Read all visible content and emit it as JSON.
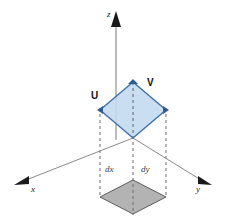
{
  "figure": {
    "background_color": "#ffffff"
  },
  "axes": {
    "origin": {
      "x": 133,
      "y": 138
    },
    "items": [
      {
        "name": "z",
        "label": "z",
        "label_x": 110,
        "label_y": 16,
        "line": {
          "x1": 116,
          "y1": 138,
          "x2": 116,
          "y2": 22
        },
        "arrow": "up",
        "color": "#8c8c8c"
      },
      {
        "name": "x",
        "label": "x",
        "label_x": 31,
        "label_y": 192,
        "line": {
          "x1": 133,
          "y1": 138,
          "x2": 22,
          "y2": 182
        },
        "arrow": "down-left",
        "color": "#6f6f6f"
      },
      {
        "name": "y",
        "label": "y",
        "label_x": 196,
        "label_y": 192,
        "line": {
          "x1": 133,
          "y1": 138,
          "x2": 205,
          "y2": 182
        },
        "arrow": "down-right",
        "color": "#6f6f6f"
      }
    ]
  },
  "blue_face": {
    "name": "parallelogram-uv",
    "fill": "#c3d9ef",
    "stroke": "#3e6fa8",
    "opacity": 0.85,
    "vertices": [
      {
        "x": 133,
        "y": 82
      },
      {
        "x": 166,
        "y": 110
      },
      {
        "x": 133,
        "y": 138
      },
      {
        "x": 100,
        "y": 110
      }
    ],
    "vertex_markers": [
      {
        "x": 133,
        "y": 82
      },
      {
        "x": 166,
        "y": 110
      },
      {
        "x": 100,
        "y": 110
      }
    ]
  },
  "gray_face": {
    "name": "projection-square",
    "fill": "#b3b3b3",
    "stroke": "#5d5d5d",
    "vertices": [
      {
        "x": 133,
        "y": 180
      },
      {
        "x": 166,
        "y": 197
      },
      {
        "x": 133,
        "y": 214
      },
      {
        "x": 100,
        "y": 197
      }
    ]
  },
  "vectors": [
    {
      "name": "U",
      "label": "U",
      "label_x": 93,
      "label_y": 98
    },
    {
      "name": "V",
      "label": "V",
      "label_x": 148,
      "label_y": 85
    }
  ],
  "dimension_labels": [
    {
      "name": "dx",
      "label": "dx",
      "label_x": 105,
      "label_y": 170
    },
    {
      "name": "dy",
      "label": "dy",
      "label_x": 141,
      "label_y": 170
    }
  ],
  "dashed_lines": {
    "color": "#6b6b6b",
    "dash": "3,3",
    "segments": [
      {
        "name": "drop-left",
        "x1": 100,
        "y1": 110,
        "x2": 100,
        "y2": 197
      },
      {
        "name": "drop-center",
        "x1": 133,
        "y1": 82,
        "x2": 133,
        "y2": 214
      },
      {
        "name": "drop-right",
        "x1": 166,
        "y1": 110,
        "x2": 166,
        "y2": 197
      }
    ]
  },
  "colors": {
    "blue_fill": "#c3d9ef",
    "blue_stroke": "#3e6fa8",
    "gray_fill": "#b3b3b3",
    "gray_stroke": "#5d5d5d",
    "axis": "#808080",
    "dashed": "#6b6b6b",
    "text": "#111111"
  }
}
